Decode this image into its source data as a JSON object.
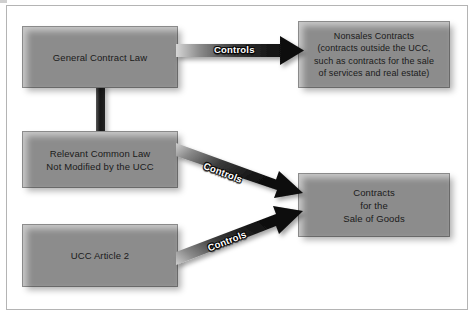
{
  "diagram": {
    "background_color": "#ffffff",
    "frame_color": "#b4b4b4",
    "node_fill_color": "#c9c9c9",
    "node_border_color": "#8e8e8e",
    "arrow_dark_color": "#101010",
    "arrow_light_color": "#d2d2d2",
    "nodes": [
      {
        "id": "general-contract-law",
        "text": "General Contract Law"
      },
      {
        "id": "relevant-common-law",
        "text": "Relevant Common Law\nNot Modified by the UCC"
      },
      {
        "id": "ucc-article-2",
        "text": "UCC Article 2"
      },
      {
        "id": "nonsales-contracts",
        "text": "Nonsales Contracts\n(contracts outside the UCC,\nsuch as contracts for the sale\nof services and real estate)"
      },
      {
        "id": "contracts-sale-goods",
        "text": "Contracts\nfor the\nSale of Goods"
      }
    ],
    "nodes_lines": {
      "general_contract_law": [
        "General Contract Law"
      ],
      "relevant_common_law": [
        "Relevant Common Law",
        "Not Modified by the UCC"
      ],
      "ucc_article_2": [
        "UCC Article 2"
      ],
      "nonsales_contracts": [
        "Nonsales Contracts",
        "(contracts outside the UCC,",
        "such as contracts for the sale",
        "of services and real estate)"
      ],
      "contracts_sale_goods": [
        "Contracts",
        "for the",
        "Sale of Goods"
      ]
    },
    "edges": [
      {
        "id": "edge-1",
        "from": "general-contract-law",
        "to": "nonsales-contracts",
        "label": "Controls",
        "direction": "horizontal"
      },
      {
        "id": "edge-2",
        "from": "relevant-common-law",
        "to": "contracts-sale-goods",
        "label": "Controls",
        "direction": "down-right"
      },
      {
        "id": "edge-3",
        "from": "ucc-article-2",
        "to": "contracts-sale-goods",
        "label": "Controls",
        "direction": "up-right"
      },
      {
        "id": "edge-4",
        "from": "general-contract-law",
        "to": "relevant-common-law",
        "label": "",
        "direction": "vertical-bar"
      }
    ]
  }
}
